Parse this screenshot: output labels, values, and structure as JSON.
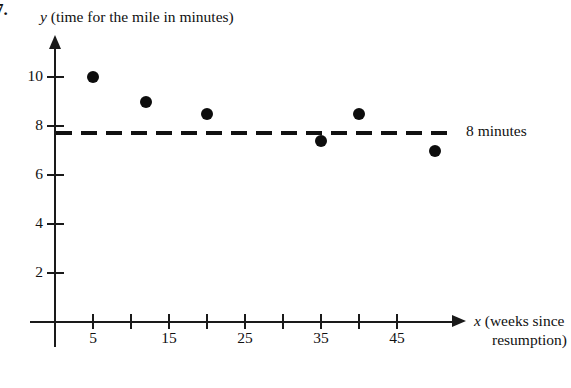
{
  "figure": {
    "problem_number": "7.",
    "y_caption_symbol": "y",
    "y_caption_text": " (time for the mile in minutes)",
    "x_caption_symbol": "x",
    "x_caption_line1": " (weeks since",
    "x_caption_line2": "resumption)",
    "reference_label": "8 minutes"
  },
  "chart_data": {
    "type": "scatter",
    "title": "y (time for the mile in minutes)",
    "xlabel": "x (weeks since resumption)",
    "ylabel": "y (time for the mile in minutes)",
    "xlim": [
      0,
      55
    ],
    "ylim": [
      0,
      11
    ],
    "grid": false,
    "legend": false,
    "x_ticks": [
      5,
      10,
      15,
      20,
      25,
      30,
      35,
      40,
      45
    ],
    "x_tick_labels": [
      "5",
      "",
      "15",
      "",
      "25",
      "",
      "35",
      "",
      "45"
    ],
    "y_ticks": [
      2,
      4,
      6,
      8,
      10
    ],
    "y_tick_labels": [
      "2",
      "4",
      "6",
      "8",
      "10"
    ],
    "points": [
      {
        "x": 5,
        "y": 10.0
      },
      {
        "x": 12,
        "y": 9.0
      },
      {
        "x": 20,
        "y": 8.5
      },
      {
        "x": 35,
        "y": 7.4
      },
      {
        "x": 40,
        "y": 8.5
      },
      {
        "x": 50,
        "y": 7.0
      }
    ],
    "reference_line": {
      "y": 8,
      "style": "dashed",
      "label": "8 minutes"
    },
    "marker_color": "#0d0d0d",
    "axis_color": "#1a1a1a"
  }
}
